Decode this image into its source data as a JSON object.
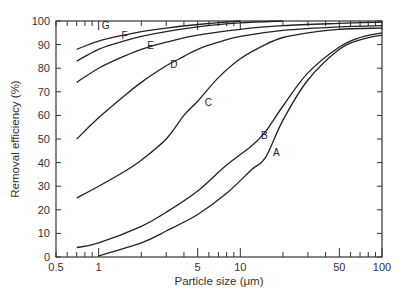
{
  "chart_data": {
    "type": "line",
    "title": "",
    "xlabel": "Particle size (μm)",
    "ylabel": "Removal efficiency (%)",
    "xscale": "log",
    "xlim": [
      0.5,
      100
    ],
    "ylim": [
      0,
      100
    ],
    "x_ticks": [
      0.5,
      1,
      5,
      10,
      50,
      100
    ],
    "x_tick_labels": [
      "0.5",
      "1",
      "5",
      "10",
      "50",
      "100"
    ],
    "y_ticks": [
      0,
      10,
      20,
      30,
      40,
      50,
      60,
      70,
      80,
      90,
      100
    ],
    "y_tick_labels": [
      "0",
      "10",
      "20",
      "30",
      "40",
      "50",
      "60",
      "70",
      "80",
      "90",
      "100"
    ],
    "grid": false,
    "legend": "none (curves labeled inline A–G)",
    "series": [
      {
        "name": "A",
        "x": [
          1,
          2,
          3,
          5,
          8,
          12,
          15,
          20,
          30,
          50,
          70,
          100
        ],
        "y": [
          0.5,
          6,
          11,
          18,
          27,
          37,
          42,
          58,
          75,
          88,
          92,
          94
        ]
      },
      {
        "name": "B",
        "x": [
          0.7,
          1,
          2,
          3,
          5,
          8,
          12,
          15,
          20,
          30,
          50,
          70,
          100
        ],
        "y": [
          4,
          6,
          13,
          19,
          28,
          39,
          47,
          53,
          64,
          78,
          89,
          93,
          95
        ]
      },
      {
        "name": "C",
        "x": [
          0.7,
          1,
          1.5,
          2,
          3,
          4,
          5,
          7,
          10,
          15,
          20,
          30,
          50,
          100
        ],
        "y": [
          25,
          30,
          36,
          41,
          50,
          60,
          66,
          76,
          84,
          90,
          93,
          95,
          96.5,
          97
        ]
      },
      {
        "name": "D",
        "x": [
          0.7,
          1,
          1.5,
          2,
          3,
          4,
          5,
          7,
          10,
          20,
          50,
          100
        ],
        "y": [
          50,
          59,
          68,
          74,
          81,
          85,
          88,
          91,
          93.5,
          96,
          97.5,
          98
        ]
      },
      {
        "name": "E",
        "x": [
          0.7,
          1,
          1.5,
          2,
          3,
          5,
          10,
          20,
          50,
          100
        ],
        "y": [
          74,
          80,
          85,
          88,
          91,
          94,
          96.5,
          98,
          99,
          99.5
        ]
      },
      {
        "name": "F",
        "x": [
          0.7,
          1,
          1.5,
          2,
          3,
          5,
          10,
          20
        ],
        "y": [
          83,
          88,
          91.5,
          93.5,
          95.5,
          97.5,
          99.2,
          100
        ]
      },
      {
        "name": "G",
        "x": [
          0.7,
          1,
          1.5,
          2,
          3,
          5,
          10
        ],
        "y": [
          88,
          91.5,
          94,
          95.5,
          97,
          98.5,
          100
        ]
      }
    ],
    "curve_label_positions": [
      {
        "name": "A",
        "x": 17,
        "y": 43
      },
      {
        "name": "B",
        "x": 14,
        "y": 50
      },
      {
        "name": "C",
        "x": 5.6,
        "y": 64
      },
      {
        "name": "D",
        "x": 3.2,
        "y": 80
      },
      {
        "name": "E",
        "x": 2.2,
        "y": 88
      },
      {
        "name": "F",
        "x": 1.45,
        "y": 92.5
      },
      {
        "name": "G",
        "x": 1.05,
        "y": 96.5
      }
    ]
  },
  "colors": {
    "line": "#222222",
    "axis": "#333333",
    "background": "#ffffff"
  }
}
